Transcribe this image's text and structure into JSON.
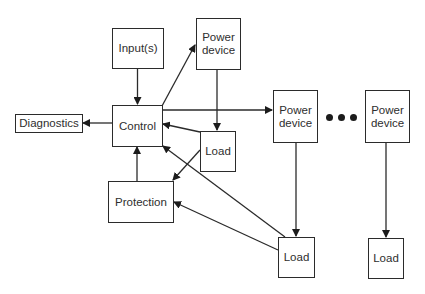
{
  "diagram": {
    "nodes": [
      {
        "id": "inputs",
        "label": "Input(s)"
      },
      {
        "id": "power_device_1",
        "label": "Power\ndevice"
      },
      {
        "id": "diagnostics",
        "label": "Diagnostics"
      },
      {
        "id": "control",
        "label": "Control"
      },
      {
        "id": "load_1",
        "label": "Load"
      },
      {
        "id": "power_device_2",
        "label": "Power\ndevice"
      },
      {
        "id": "power_device_3",
        "label": "Power\ndevice"
      },
      {
        "id": "protection",
        "label": "Protection"
      },
      {
        "id": "load_2",
        "label": "Load"
      },
      {
        "id": "load_3",
        "label": "Load"
      }
    ],
    "edges": [
      {
        "from": "inputs",
        "to": "control"
      },
      {
        "from": "control",
        "to": "power_device_1"
      },
      {
        "from": "control",
        "to": "diagnostics"
      },
      {
        "from": "control",
        "to": "power_device_2"
      },
      {
        "from": "power_device_1",
        "to": "load_1"
      },
      {
        "from": "load_1",
        "to": "control"
      },
      {
        "from": "load_1",
        "to": "protection"
      },
      {
        "from": "protection",
        "to": "control"
      },
      {
        "from": "load_2",
        "to": "control"
      },
      {
        "from": "load_2",
        "to": "protection"
      },
      {
        "from": "power_device_2",
        "to": "load_2"
      },
      {
        "from": "power_device_3",
        "to": "load_3"
      }
    ],
    "ellipsis": "• • •"
  }
}
